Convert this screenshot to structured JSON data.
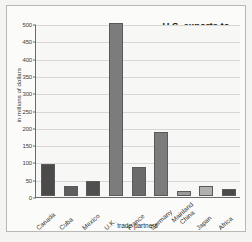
{
  "chart_data": {
    "type": "bar",
    "title": "U.S. exports to principal trade partners, 1900",
    "title_lines": [
      "U.S. exports to",
      "principal trade",
      "partners, 1900"
    ],
    "xlabel": "trade partners",
    "ylabel": "in millions of dollars",
    "categories": [
      "Canada",
      "Cuba",
      "Mexico",
      "U.K.",
      "France",
      "Germany",
      "Mainland China",
      "Japan",
      "Africa"
    ],
    "values": [
      92,
      28,
      43,
      500,
      85,
      186,
      14,
      30,
      21
    ],
    "bar_colors": [
      "#4a4a4a",
      "#5e5e5e",
      "#4f4f4f",
      "#7c7c7c",
      "#6a6a6a",
      "#7c7c7c",
      "#9a9a9a",
      "#b0b0b0",
      "#4a4a4a"
    ],
    "ylim": [
      0,
      500
    ],
    "yticks": [
      0,
      50,
      100,
      150,
      200,
      250,
      300,
      350,
      400,
      450,
      500
    ],
    "ytick_labels": [
      "0",
      "50",
      "100",
      "150",
      "200",
      "250",
      "300",
      "350",
      "400",
      "450",
      "500"
    ],
    "grid": true,
    "legend": "none"
  },
  "colors": {
    "figure_background": "#fbfbfa",
    "plot_background": "#f7f7f6",
    "axis": "#6b6b6b",
    "gridline": "#d6d6d4",
    "text": "#2e2e2e"
  }
}
